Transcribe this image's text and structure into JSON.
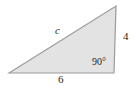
{
  "figure": {
    "type": "right-triangle-diagram",
    "fill_color": "#e3e3e3",
    "stroke_color": "#9a9a9a",
    "background_color": "#ffffff",
    "text_color": "#231f20",
    "labels": {
      "hypotenuse": "c",
      "vertical_leg": "4",
      "horizontal_leg": "6",
      "right_angle": "90°"
    },
    "vertices": {
      "left": [
        9,
        73
      ],
      "top_right": [
        116,
        6
      ],
      "bottom_right": [
        114,
        73
      ]
    }
  },
  "chart_data": {
    "type": "diagram",
    "title": "",
    "shape": "right triangle",
    "sides": [
      {
        "name": "hypotenuse",
        "label": "c",
        "value": null
      },
      {
        "name": "vertical leg",
        "label": "4",
        "value": 4
      },
      {
        "name": "horizontal leg",
        "label": "6",
        "value": 6
      }
    ],
    "angles": [
      {
        "name": "right angle",
        "label": "90°",
        "value": 90,
        "vertex": "bottom-right"
      }
    ]
  }
}
